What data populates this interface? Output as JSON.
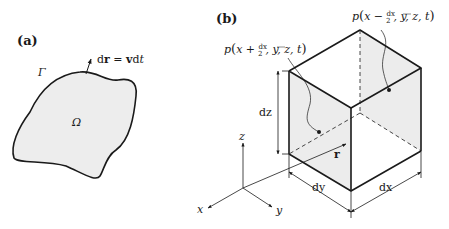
{
  "panel_a": {
    "label": "(a)",
    "boundary_label": "Γ",
    "domain_label": "Ω",
    "vector_label": "dr = vdt",
    "vector_label_parts": {
      "d1": "d",
      "r": "r",
      "eq": " = ",
      "v": "v",
      "d2": "d",
      "t": "t"
    },
    "fill_color": "#ededed",
    "stroke_color": "#1a1a1a"
  },
  "panel_b": {
    "label": "(b)",
    "pressure_left": {
      "p": "p",
      "open": "(",
      "x": "x",
      "op": " + ",
      "num": "dx",
      "den": "2",
      "rest": ", y, z, t",
      "close": ")"
    },
    "pressure_right": {
      "p": "p",
      "open": "(",
      "x": "x",
      "op": " − ",
      "num": "dx",
      "den": "2",
      "rest": ", y, z, t",
      "close": ")"
    },
    "dim_z": "dz",
    "dim_y": "dy",
    "dim_x": "dx",
    "position_vector": "r",
    "axes": {
      "x": "x",
      "y": "y",
      "z": "z"
    },
    "face_fill": "#ececec",
    "edge_color": "#1a1a1a"
  }
}
